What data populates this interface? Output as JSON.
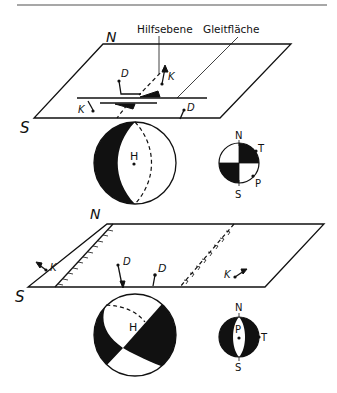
{
  "figure": {
    "top_rule_color": "#8a8a8a",
    "ink_color": "#111111",
    "upper_block": {
      "compass_north": "N",
      "compass_south": "S",
      "callouts": {
        "auxiliary_plane": "Hilfsebene",
        "slip_plane": "Gleitfläche"
      },
      "vector_labels": {
        "d_upper": "D",
        "k_upper": "K",
        "k_lower": "K",
        "d_lower": "D"
      },
      "sphere_label": "H",
      "stereonet": {
        "north": "N",
        "south": "S",
        "t_axis": "T",
        "p_axis": "P"
      }
    },
    "lower_block": {
      "compass_north": "N",
      "compass_south": "S",
      "vector_labels": {
        "k_left": "K",
        "d_left": "D",
        "d_mid": "D",
        "k_right": "K"
      },
      "sphere_label": "H",
      "stereonet": {
        "north": "N",
        "south": "S",
        "p_axis": "P",
        "t_axis": "T"
      }
    }
  }
}
